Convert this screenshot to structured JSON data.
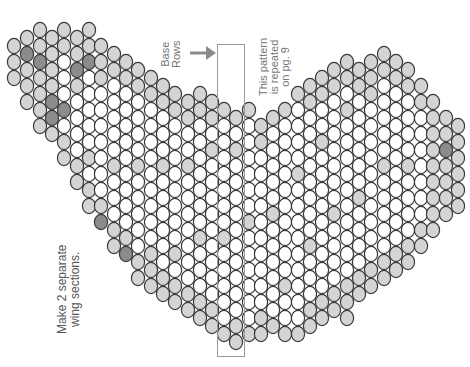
{
  "labels": {
    "base_rows": [
      "Base",
      "Rows"
    ],
    "repeated": [
      "This pattern",
      "is repeated",
      "on pg. 9"
    ],
    "instruction": [
      "Make 2 separate",
      "wing sections."
    ]
  },
  "colors": {
    "white": "#ffffff",
    "light": "#d4d4d4",
    "dark": "#8c8c8c",
    "outline": "#3a3a3a",
    "arrow": "#8a8a8a",
    "text": "#777777"
  },
  "base_box": {
    "x": 217,
    "y": 44,
    "w": 26,
    "h": 311
  },
  "bead": {
    "rx": 6.6,
    "ry": 7.6,
    "dy": 16
  },
  "columns": [
    {
      "x": 14,
      "top": 46,
      "bot": 78,
      "light": "all"
    },
    {
      "x": 27,
      "top": 38,
      "bot": 102,
      "light": "all",
      "dark": [
        54
      ]
    },
    {
      "x": 40,
      "top": 30,
      "bot": 126,
      "light": "all",
      "dark": [
        62
      ]
    },
    {
      "x": 52,
      "top": 38,
      "bot": 142,
      "light": "all",
      "dark": [
        102,
        118
      ]
    },
    {
      "x": 64,
      "top": 30,
      "bot": 166,
      "light": "edge2",
      "dark": [
        110
      ]
    },
    {
      "x": 77,
      "top": 38,
      "bot": 182,
      "light": "edge2",
      "dark": [
        70,
        174
      ]
    },
    {
      "x": 89,
      "top": 30,
      "bot": 206,
      "light": "edge2",
      "dark": [
        62
      ]
    },
    {
      "x": 101,
      "top": 46,
      "bot": 230,
      "light": "edge2",
      "dark": [
        222
      ]
    },
    {
      "x": 114,
      "top": 54,
      "bot": 246,
      "light": "edge2"
    },
    {
      "x": 126,
      "top": 62,
      "bot": 262,
      "light": "edge2",
      "dark": [
        254
      ]
    },
    {
      "x": 138,
      "top": 70,
      "bot": 286,
      "light": "edge2",
      "dark": [
        286
      ]
    },
    {
      "x": 151,
      "top": 78,
      "bot": 294,
      "light": "edge2"
    },
    {
      "x": 163,
      "top": 86,
      "bot": 302,
      "light": "edge2"
    },
    {
      "x": 175,
      "top": 94,
      "bot": 310,
      "light": "edge2"
    },
    {
      "x": 188,
      "top": 102,
      "bot": 318,
      "light": "edge2"
    },
    {
      "x": 200,
      "top": 94,
      "bot": 326,
      "light": "edge2"
    },
    {
      "x": 212,
      "top": 102,
      "bot": 334,
      "light": "edge2"
    },
    {
      "x": 224,
      "top": 110,
      "bot": 342,
      "light": "edge1"
    },
    {
      "x": 236,
      "top": 118,
      "bot": 342,
      "light": "edge1"
    },
    {
      "x": 249,
      "top": 110,
      "bot": 334,
      "light": "edge1"
    },
    {
      "x": 261,
      "top": 126,
      "bot": 342,
      "light": "edge1"
    },
    {
      "x": 273,
      "top": 118,
      "bot": 334,
      "light": "edge1"
    },
    {
      "x": 285,
      "top": 110,
      "bot": 342,
      "light": "edge1"
    },
    {
      "x": 298,
      "top": 94,
      "bot": 334,
      "light": "edge1"
    },
    {
      "x": 310,
      "top": 86,
      "bot": 326,
      "light": "edge2",
      "dark": [
        94
      ]
    },
    {
      "x": 322,
      "top": 78,
      "bot": 318,
      "light": "edge2"
    },
    {
      "x": 334,
      "top": 70,
      "bot": 310,
      "light": "edge2"
    },
    {
      "x": 347,
      "top": 62,
      "bot": 318,
      "light": "edge2",
      "dark": [
        70,
        310
      ]
    },
    {
      "x": 359,
      "top": 70,
      "bot": 302,
      "light": "edge2"
    },
    {
      "x": 371,
      "top": 62,
      "bot": 294,
      "light": "edge2"
    },
    {
      "x": 384,
      "top": 54,
      "bot": 286,
      "light": "edge2",
      "dark": [
        62
      ]
    },
    {
      "x": 396,
      "top": 62,
      "bot": 270,
      "light": "edge2"
    },
    {
      "x": 408,
      "top": 70,
      "bot": 262,
      "light": "edge2"
    },
    {
      "x": 421,
      "top": 86,
      "bot": 246,
      "light": "edge2",
      "dark": [
        94,
        262
      ]
    },
    {
      "x": 433,
      "top": 102,
      "bot": 238,
      "light": "all",
      "dark": [
        174
      ]
    },
    {
      "x": 446,
      "top": 118,
      "bot": 222,
      "light": "all",
      "dark": [
        150
      ]
    },
    {
      "x": 458,
      "top": 126,
      "bot": 206,
      "light": "all"
    }
  ]
}
